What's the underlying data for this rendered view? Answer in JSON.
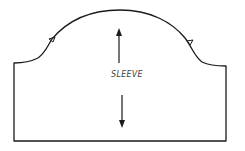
{
  "diagram": {
    "type": "sewing-pattern-piece",
    "piece_label": "SLEEVE",
    "grainline": "vertical double-headed arrow",
    "notches": [
      "front-notch-left",
      "back-notch-right"
    ],
    "colors": {
      "outline": "#1a1a1a",
      "text": "#444444",
      "background": "#ffffff"
    }
  }
}
